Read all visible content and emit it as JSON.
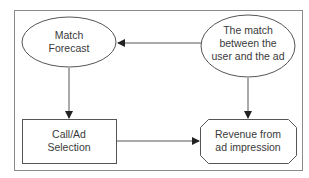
{
  "diagram": {
    "nodes": {
      "match_forecast": {
        "shape": "ellipse",
        "lines": [
          "Match",
          "Forecast"
        ]
      },
      "user_ad_match": {
        "shape": "ellipse",
        "lines": [
          "The match",
          "between the",
          "user and the ad"
        ]
      },
      "call_ad_selection": {
        "shape": "rectangle",
        "lines": [
          "Call/Ad",
          "Selection"
        ]
      },
      "revenue": {
        "shape": "octagon",
        "lines": [
          "Revenue from",
          "ad impression"
        ]
      }
    },
    "edges": [
      {
        "from": "user_ad_match",
        "to": "match_forecast"
      },
      {
        "from": "match_forecast",
        "to": "call_ad_selection"
      },
      {
        "from": "user_ad_match",
        "to": "revenue"
      },
      {
        "from": "call_ad_selection",
        "to": "revenue"
      }
    ],
    "colors": {
      "stroke": "#555555",
      "frame": "#8a8a8a",
      "text": "#3a3a3a",
      "background": "#ffffff"
    }
  }
}
